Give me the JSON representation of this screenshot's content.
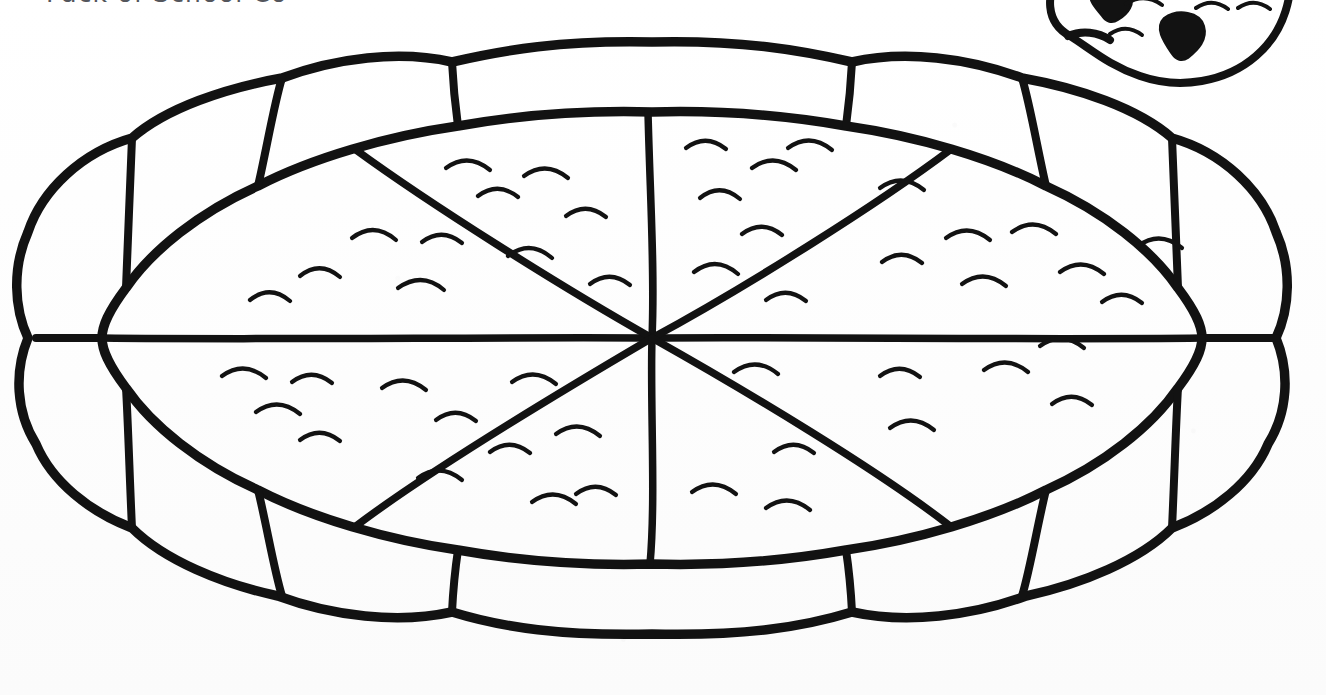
{
  "page": {
    "width": 1326,
    "height": 695,
    "kind": "scanned-coloring-page",
    "background_color": "#fdfdfd",
    "ink_color": "#121212"
  },
  "title": {
    "text": "Pack of School Cookbooks",
    "visible_fragment": "Pack of School Co",
    "color": "#54565c",
    "note": "cropped by top edge of scan"
  },
  "artwork": {
    "name": "whole-pizza-line-drawing",
    "description": "Large oval pizza seen from above with a lumpy puffed crust, cut into eight triangular slices, sprinkled with small curved topping marks.",
    "slice_count": 8,
    "crust_lobe_count": 14,
    "topping_mark_count": 48,
    "center_point": {
      "x": 652,
      "y": 338
    },
    "bounds": {
      "x": 58,
      "y": 42,
      "width": 1230,
      "height": 608
    }
  },
  "corner_decoration": {
    "name": "pizza-slice-corner-motif",
    "description": "Partially cropped small pizza shape in the top-right corner with two solid dark pepperoni blobs and small curved topping marks.",
    "pepperoni_count": 2,
    "topping_mark_count": 5,
    "bounds": {
      "x": 1052,
      "y": 0,
      "width": 274,
      "height": 92
    }
  }
}
